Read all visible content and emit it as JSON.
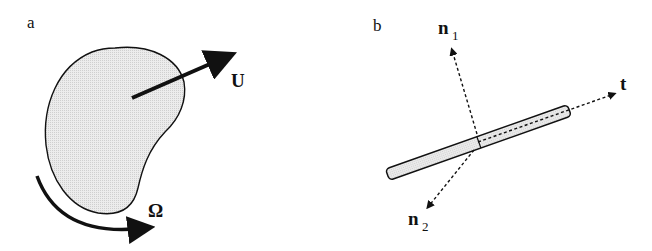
{
  "panel_a": {
    "label": "a",
    "velocity_label": "U",
    "rotation_label": "Ω"
  },
  "panel_b": {
    "label": "b",
    "normal1_label": "n",
    "normal1_sub": "1",
    "normal2_label": "n",
    "normal2_sub": "2",
    "tangent_label": "t"
  },
  "colors": {
    "fill": "#e2e2e2",
    "stroke": "#111111"
  }
}
